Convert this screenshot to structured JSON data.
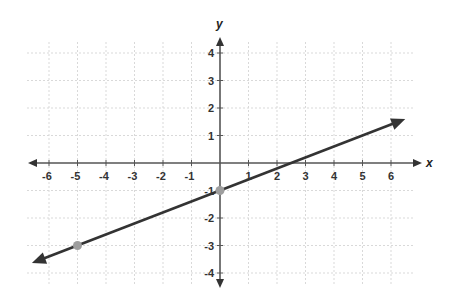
{
  "chart_data": {
    "type": "line",
    "title": "",
    "xlabel": "x",
    "ylabel": "y",
    "xlim": [
      -6.5,
      6.5
    ],
    "ylim": [
      -4.3,
      4.5
    ],
    "grid": true,
    "grid_style": "dotted",
    "x_ticks": [
      -6,
      -5,
      -4,
      -3,
      -2,
      -1,
      1,
      2,
      3,
      4,
      5,
      6
    ],
    "y_ticks": [
      4,
      3,
      2,
      1,
      -1,
      -2,
      -3,
      -4
    ],
    "series": [
      {
        "name": "line",
        "equation": "y = (2/5)x - 1",
        "slope": 0.4,
        "intercept": -1,
        "x": [
          -6.6,
          6.5
        ],
        "y": [
          -3.64,
          1.6
        ],
        "arrows": "both",
        "color": "#333333"
      }
    ],
    "points": [
      {
        "x": -5,
        "y": -3,
        "color": "#9e9e9e"
      },
      {
        "x": 0,
        "y": -1,
        "color": "#9e9e9e"
      }
    ],
    "legend": null
  },
  "colors": {
    "axis": "#555555",
    "grid": "#d9d9d9",
    "line": "#333333",
    "point": "#9e9e9e"
  }
}
